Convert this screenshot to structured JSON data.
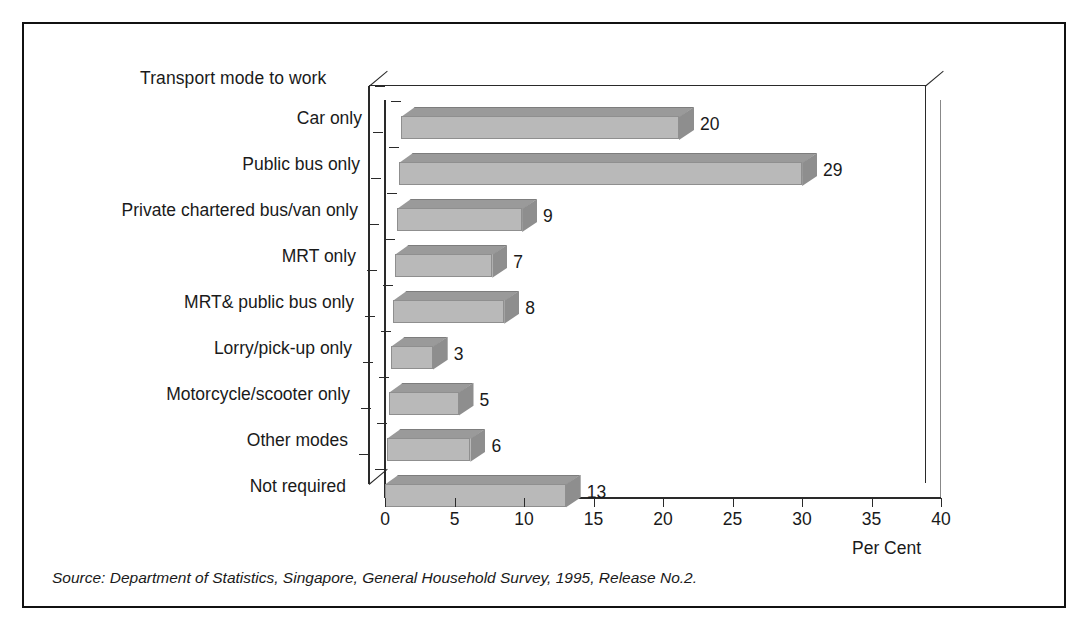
{
  "frame": {
    "border_color": "#111111"
  },
  "chart_data": {
    "type": "bar",
    "orientation": "horizontal",
    "title": "Transport mode to work",
    "xlabel": "Per Cent",
    "ylabel": "",
    "xlim": [
      0,
      40
    ],
    "xticks": [
      0,
      5,
      10,
      15,
      20,
      25,
      30,
      35,
      40
    ],
    "grid": false,
    "legend": null,
    "style": "3d-horizontal-bar",
    "colors": {
      "bar_front": "#b9b9b9",
      "bar_top": "#9a9a9a",
      "bar_side": "#8e8e8e",
      "axis": "#2a2a2a"
    },
    "categories": [
      "Car only",
      "Public bus only",
      "Private chartered bus/van only",
      "MRT only",
      "MRT& public bus only",
      "Lorry/pick-up only",
      "Motorcycle/scooter only",
      "Other modes",
      "Not required"
    ],
    "values": [
      20,
      29,
      9,
      7,
      8,
      3,
      5,
      6,
      13
    ],
    "data_labels": [
      "20",
      "29",
      "9",
      "7",
      "8",
      "3",
      "5",
      "6",
      "13"
    ],
    "source": "Source: Department of Statistics, Singapore, General Household Survey, 1995, Release No.2."
  },
  "axis": {
    "tick_labels": [
      "0",
      "5",
      "10",
      "15",
      "20",
      "25",
      "30",
      "35",
      "40"
    ],
    "unit_label": "Per Cent"
  }
}
